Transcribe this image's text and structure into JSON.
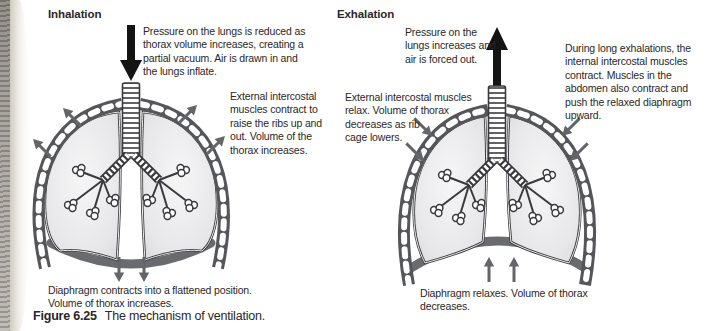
{
  "figure": {
    "caption_label": "Figure 6.25",
    "caption_text": "The mechanism of ventilation."
  },
  "inhalation": {
    "title": "Inhalation",
    "pressure_note": "Pressure on the lungs is reduced as\nthorax volume increases, creating a\npartial vacuum. Air is drawn in and\nthe lungs inflate.",
    "intercostal_note": "External intercostal\nmuscles contract to\nraise the ribs up and\nout. Volume of the\nthorax increases.",
    "diaphragm_note": "Diaphragm contracts into a flattened position.\nVolume of thorax increases."
  },
  "exhalation": {
    "title": "Exhalation",
    "pressure_note": "Pressure on the\nlungs increases and\nair is forced out.",
    "internal_intercostal_note": "During long exhalations, the\ninternal intercostal muscles\ncontract. Muscles in the\nabdomen also contract and\npush the relaxed diaphragm\nupward.",
    "intercostal_note": "External intercostal muscles\nrelax. Volume of thorax\ndecreases as rib\ncage lowers.",
    "diaphragm_note": "Diaphragm relaxes. Volume of thorax\ndecreases."
  },
  "colors": {
    "text": "#2b2728",
    "gray_arrow": "#646569",
    "black_arrow": "#141414",
    "rib_band": "#55565a",
    "diaphragm": "#6a6b6e",
    "lung_fill": "#e9e9eb",
    "outline": "#3a3a3e"
  }
}
